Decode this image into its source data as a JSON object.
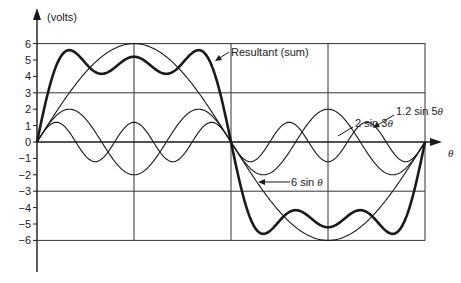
{
  "chart_data": {
    "type": "line",
    "title": "",
    "ylabel": "(volts)",
    "xlabel": "θ",
    "ylim": [
      -6,
      6
    ],
    "xlim_degrees": [
      0,
      360
    ],
    "y_ticks": [
      6,
      5,
      4,
      3,
      2,
      1,
      0,
      -1,
      -2,
      -3,
      -4,
      -5,
      -6
    ],
    "y_tick_labels": [
      "6",
      "5",
      "4",
      "3",
      "2",
      "1",
      "0",
      "−1",
      "−2",
      "−3",
      "−4",
      "−5",
      "−6"
    ],
    "horizontal_gridlines": [
      6,
      3,
      0,
      -3,
      -6
    ],
    "vertical_gridlines_degrees": [
      90,
      180,
      270,
      360
    ],
    "grid": true,
    "legend": "none (annotations with arrows)",
    "series": [
      {
        "name": "6 sin θ",
        "amplitude": 6,
        "harmonic": 1,
        "stroke": "thin",
        "label": "6 sin θ"
      },
      {
        "name": "2 sin 3θ",
        "amplitude": 2,
        "harmonic": 3,
        "stroke": "thin",
        "label": "2 sin 3θ"
      },
      {
        "name": "1.2 sin 5θ",
        "amplitude": 1.2,
        "harmonic": 5,
        "stroke": "thin",
        "label": "1.2 sin 5θ"
      },
      {
        "name": "Resultant (sum)",
        "formula": "6 sin θ + 2 sin 3θ + 1.2 sin 5θ",
        "stroke": "bold",
        "label": "Resultant (sum)"
      }
    ],
    "annotations": [
      {
        "text": "Resultant (sum)",
        "points_to": "Resultant (sum)"
      },
      {
        "text": "2 sin 3θ",
        "points_to": "2 sin 3θ"
      },
      {
        "text": "1.2 sin 5θ",
        "points_to": "1.2 sin 5θ"
      },
      {
        "text": "6 sin θ",
        "points_to": "6 sin θ"
      }
    ]
  },
  "labels": {
    "y_axis": "(volts)",
    "x_axis": "θ",
    "resultant": "Resultant (sum)",
    "s3_prefix": "2 sin 3",
    "s5_prefix": "1.2 sin 5",
    "s1_prefix": "6 sin ",
    "theta": "θ"
  },
  "colors": {
    "ink": "#1a1a1a",
    "grid": "#333333",
    "background": "#ffffff"
  }
}
